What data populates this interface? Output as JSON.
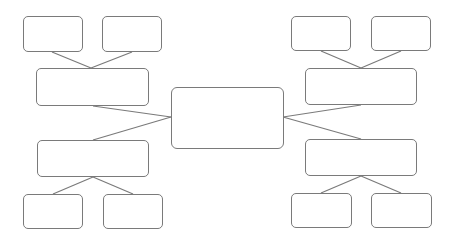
{
  "diagram": {
    "type": "mind-map",
    "background": "#ffffff",
    "stroke_color": "#7a7a7a",
    "center": {
      "label": "",
      "x": 171,
      "y": 87,
      "w": 113,
      "h": 62
    },
    "branches": [
      {
        "id": "top-left",
        "label": "",
        "x": 36,
        "y": 68,
        "w": 113,
        "h": 38,
        "children": [
          {
            "label": "",
            "x": 23,
            "y": 16,
            "w": 60,
            "h": 36
          },
          {
            "label": "",
            "x": 102,
            "y": 16,
            "w": 60,
            "h": 36
          }
        ]
      },
      {
        "id": "bottom-left",
        "label": "",
        "x": 37,
        "y": 140,
        "w": 112,
        "h": 37,
        "children": [
          {
            "label": "",
            "x": 23,
            "y": 194,
            "w": 60,
            "h": 35
          },
          {
            "label": "",
            "x": 103,
            "y": 194,
            "w": 60,
            "h": 35
          }
        ]
      },
      {
        "id": "top-right",
        "label": "",
        "x": 305,
        "y": 68,
        "w": 112,
        "h": 37,
        "children": [
          {
            "label": "",
            "x": 291,
            "y": 16,
            "w": 60,
            "h": 35
          },
          {
            "label": "",
            "x": 371,
            "y": 16,
            "w": 60,
            "h": 35
          }
        ]
      },
      {
        "id": "bottom-right",
        "label": "",
        "x": 305,
        "y": 139,
        "w": 112,
        "h": 37,
        "children": [
          {
            "label": "",
            "x": 291,
            "y": 193,
            "w": 61,
            "h": 35
          },
          {
            "label": "",
            "x": 371,
            "y": 193,
            "w": 61,
            "h": 35
          }
        ]
      }
    ],
    "connectors": [
      {
        "x1": 52,
        "y1": 52,
        "x2": 91,
        "y2": 68
      },
      {
        "x1": 132,
        "y1": 52,
        "x2": 91,
        "y2": 68
      },
      {
        "x1": 93,
        "y1": 106,
        "x2": 171,
        "y2": 117
      },
      {
        "x1": 93,
        "y1": 140,
        "x2": 171,
        "y2": 117
      },
      {
        "x1": 93,
        "y1": 177,
        "x2": 53,
        "y2": 194
      },
      {
        "x1": 93,
        "y1": 177,
        "x2": 133,
        "y2": 194
      },
      {
        "x1": 321,
        "y1": 51,
        "x2": 361,
        "y2": 68
      },
      {
        "x1": 401,
        "y1": 51,
        "x2": 361,
        "y2": 68
      },
      {
        "x1": 361,
        "y1": 105,
        "x2": 283,
        "y2": 117
      },
      {
        "x1": 361,
        "y1": 139,
        "x2": 283,
        "y2": 117
      },
      {
        "x1": 361,
        "y1": 176,
        "x2": 321,
        "y2": 193
      },
      {
        "x1": 361,
        "y1": 176,
        "x2": 401,
        "y2": 193
      }
    ]
  }
}
